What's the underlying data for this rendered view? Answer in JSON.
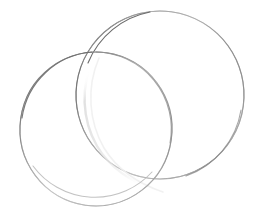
{
  "scene": {
    "title": "Two overlapping thin metal wire rings on white background",
    "width": 258,
    "height": 217,
    "background_color": "#ffffff",
    "object_count": 2,
    "object_type": "wire-ring",
    "material": "thin silver / stainless steel wire hoop"
  },
  "objects": [
    {
      "id": "ring-back",
      "label": "Upper-right wire ring",
      "position": "upper-right",
      "depth": "behind",
      "cx": 160,
      "cy": 95,
      "rx": 84,
      "ry": 84,
      "rotation_deg": -14,
      "stroke_color": "#767676",
      "stroke_highlight_color": "#c9c9c9",
      "stroke_width": 1.1,
      "bbox": {
        "x": 76,
        "y": 11,
        "width": 167,
        "height": 169
      }
    },
    {
      "id": "ring-front",
      "label": "Lower-left wire ring",
      "position": "lower-left",
      "depth": "in-front",
      "cx": 96,
      "cy": 129,
      "rx": 76,
      "ry": 77,
      "rotation_deg": 8,
      "stroke_color": "#7d7d7d",
      "stroke_highlight_color": "#cfcfcf",
      "stroke_width": 1.1,
      "bbox": {
        "x": 20,
        "y": 52,
        "width": 152,
        "height": 154
      }
    }
  ],
  "ghost_arc": {
    "label": "Faint reflected inner arc inside overlap region",
    "stroke_color": "#e6e6e6",
    "stroke_width": 2.2,
    "opacity": 0.85
  },
  "intersections": [
    {
      "label": "upper crossing point",
      "x": 95,
      "y": 52
    },
    {
      "label": "lower crossing point",
      "x": 168,
      "y": 168
    }
  ],
  "palette": {
    "background": "#ffffff",
    "wire_dark": "#6a6a6a",
    "wire_mid": "#8f8f8f",
    "wire_light": "#c4c4c4",
    "wire_faint": "#e4e4e4"
  }
}
